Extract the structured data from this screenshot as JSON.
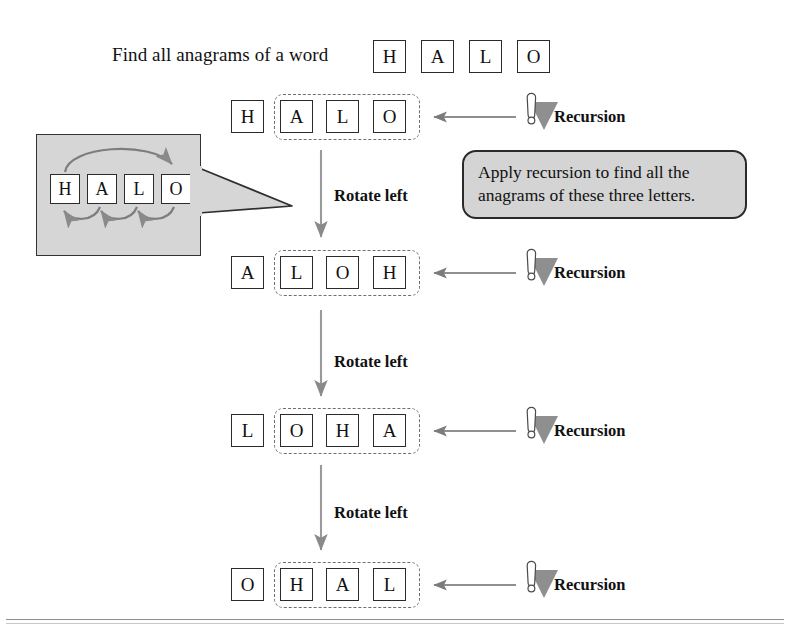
{
  "caption": {
    "text": "Find all anagrams of a word"
  },
  "top_word": {
    "letters": [
      "H",
      "A",
      "L",
      "O"
    ]
  },
  "rows": [
    {
      "id": "row-1",
      "fixed_letter": "H",
      "group_letters": [
        "A",
        "L",
        "O"
      ],
      "recursion_label": "Recursion",
      "recursion_icon": "warning-exclamation-icon",
      "arrow_icon": "left-arrow-icon"
    },
    {
      "id": "row-2",
      "fixed_letter": "A",
      "group_letters": [
        "L",
        "O",
        "H"
      ],
      "recursion_label": "Recursion",
      "recursion_icon": "warning-exclamation-icon",
      "arrow_icon": "left-arrow-icon"
    },
    {
      "id": "row-3",
      "fixed_letter": "L",
      "group_letters": [
        "O",
        "H",
        "A"
      ],
      "recursion_label": "Recursion",
      "recursion_icon": "warning-exclamation-icon",
      "arrow_icon": "left-arrow-icon"
    },
    {
      "id": "row-4",
      "fixed_letter": "O",
      "group_letters": [
        "H",
        "A",
        "L"
      ],
      "recursion_label": "Recursion",
      "recursion_icon": "warning-exclamation-icon",
      "arrow_icon": "left-arrow-icon"
    }
  ],
  "rotate_steps": [
    {
      "label": "Rotate left"
    },
    {
      "label": "Rotate left"
    },
    {
      "label": "Rotate left"
    }
  ],
  "bubble": {
    "line1": "Apply recursion to find all the",
    "line2": "anagrams of these three letters."
  },
  "inset": {
    "letters": [
      "H",
      "A",
      "L",
      "O"
    ],
    "description": "rotate-left-detail"
  },
  "colors": {
    "box_border": "#2b2b2b",
    "dashed_border": "#6f6f6f",
    "inset_fill": "#d6d6d6",
    "bubble_fill": "#d4d4d4",
    "arrow_gray": "#8a8a8a",
    "icon_triangle": "#8f8f8f",
    "text": "#111111"
  }
}
